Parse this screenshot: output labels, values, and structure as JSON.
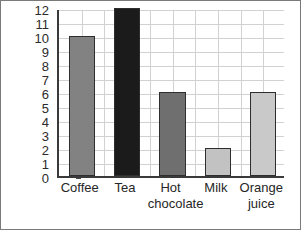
{
  "chart_data": {
    "type": "bar",
    "title": "",
    "xlabel": "",
    "ylabel": "Frequency",
    "categories": [
      "Coffee",
      "Tea",
      "Hot chocolate",
      "Milk",
      "Orange juice"
    ],
    "values": [
      10,
      12,
      6,
      2,
      6
    ],
    "ylim": [
      0,
      12
    ],
    "ytick_labels": [
      "0",
      "1",
      "2",
      "3",
      "4",
      "5",
      "6",
      "7",
      "8",
      "9",
      "10",
      "11",
      "12"
    ],
    "grid": true,
    "legend": "none",
    "bar_colors": [
      "#828282",
      "#1b1b1b",
      "#6f6f6f",
      "#c2c2c2",
      "#c9c9c9"
    ],
    "bar_edge_color": "#2e2e2e",
    "grid_color": "#d2d2d2",
    "axis_color": "#3a3a3a",
    "background": "#ffffff"
  },
  "axis": {
    "y_title": "Frequency"
  }
}
